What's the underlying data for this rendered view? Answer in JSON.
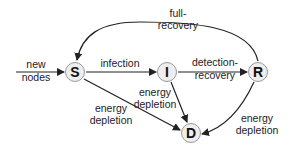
{
  "diagram": {
    "type": "state-transition",
    "nodes": [
      {
        "id": "S",
        "label": "S"
      },
      {
        "id": "I",
        "label": "I"
      },
      {
        "id": "R",
        "label": "R"
      },
      {
        "id": "D",
        "label": "D"
      }
    ],
    "edges": [
      {
        "from": "external",
        "to": "S",
        "label_line1": "new",
        "label_line2": "nodes"
      },
      {
        "from": "S",
        "to": "I",
        "label": "infection"
      },
      {
        "from": "I",
        "to": "R",
        "label_line1": "detection-",
        "label_line2": "recovery"
      },
      {
        "from": "R",
        "to": "S",
        "label_line1": "full-",
        "label_line2": "recovery"
      },
      {
        "from": "S",
        "to": "D",
        "label_line1": "energy",
        "label_line2": "depletion"
      },
      {
        "from": "I",
        "to": "D",
        "label_line1": "energy",
        "label_line2": "depletion"
      },
      {
        "from": "R",
        "to": "D",
        "label_line1": "energy",
        "label_line2": "depletion"
      }
    ]
  }
}
